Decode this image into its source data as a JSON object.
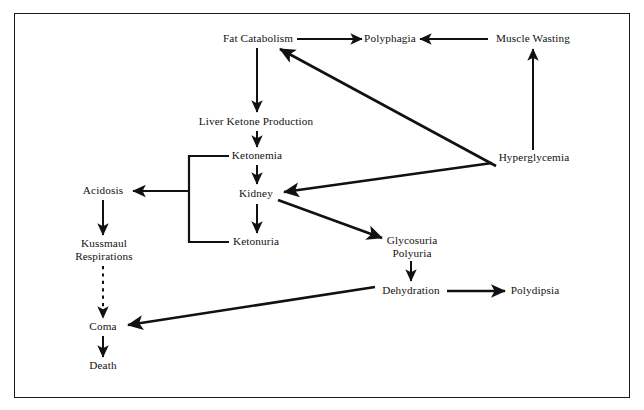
{
  "diagram": {
    "type": "flowchart",
    "border_color": "#1a1a1a",
    "line_color": "#111111",
    "background": "#ffffff",
    "nodes": [
      {
        "id": "fat_catabolism",
        "label": "Fat Catabolism",
        "x": 258,
        "y": 39
      },
      {
        "id": "polyphagia",
        "label": "Polyphagia",
        "x": 390,
        "y": 39
      },
      {
        "id": "muscle_wasting",
        "label": "Muscle Wasting",
        "x": 533,
        "y": 39
      },
      {
        "id": "liver_ketone",
        "label": "Liver Ketone Production",
        "x": 256,
        "y": 122
      },
      {
        "id": "ketonemia",
        "label": "Ketonemia",
        "x": 257,
        "y": 156
      },
      {
        "id": "hyperglycemia",
        "label": "Hyperglycemia",
        "x": 534,
        "y": 158
      },
      {
        "id": "acidosis",
        "label": "Acidosis",
        "x": 103,
        "y": 191
      },
      {
        "id": "kidney",
        "label": "Kidney",
        "x": 256,
        "y": 194
      },
      {
        "id": "ketonuria",
        "label": "Ketonuria",
        "x": 256,
        "y": 242
      },
      {
        "id": "glycosuria_polyuria",
        "label": "Glycosuria",
        "label2": "Polyuria",
        "x": 412,
        "y": 247
      },
      {
        "id": "kussmaul",
        "label": "Kussmaul",
        "label2": "Respirations",
        "x": 104,
        "y": 250
      },
      {
        "id": "dehydration",
        "label": "Dehydration",
        "x": 411,
        "y": 291
      },
      {
        "id": "polydipsia",
        "label": "Polydipsia",
        "x": 535,
        "y": 291
      },
      {
        "id": "coma",
        "label": "Coma",
        "x": 103,
        "y": 327
      },
      {
        "id": "death",
        "label": "Death",
        "x": 103,
        "y": 366
      }
    ],
    "edges": [
      {
        "id": "fat-to-polyphagia",
        "from": "fat_catabolism",
        "to": "polyphagia",
        "style": "solid",
        "arrow": "end"
      },
      {
        "id": "muscle-to-polyphagia",
        "from": "muscle_wasting",
        "to": "polyphagia",
        "style": "solid",
        "arrow": "end"
      },
      {
        "id": "hyper-to-muscle",
        "from": "hyperglycemia",
        "to": "muscle_wasting",
        "style": "solid",
        "arrow": "end"
      },
      {
        "id": "fat-to-liver",
        "from": "fat_catabolism",
        "to": "liver_ketone",
        "style": "solid",
        "arrow": "end"
      },
      {
        "id": "liver-to-ketonemia",
        "from": "liver_ketone",
        "to": "ketonemia",
        "style": "solid",
        "arrow": "end"
      },
      {
        "id": "hyper-to-fat",
        "from": "hyperglycemia",
        "to": "fat_catabolism",
        "style": "solid",
        "arrow": "end"
      },
      {
        "id": "hyper-to-kidney",
        "from": "hyperglycemia",
        "to": "kidney",
        "style": "solid",
        "arrow": "end"
      },
      {
        "id": "ketonemia-to-kidney",
        "from": "ketonemia",
        "to": "kidney",
        "style": "solid",
        "arrow": "end"
      },
      {
        "id": "kidney-to-ketonuria",
        "from": "kidney",
        "to": "ketonuria",
        "style": "solid",
        "arrow": "end"
      },
      {
        "id": "bracket-to-acidosis",
        "from": "ketonemia+ketonuria",
        "to": "acidosis",
        "style": "solid-bracket",
        "arrow": "end"
      },
      {
        "id": "kidney-to-glycosuria",
        "from": "kidney",
        "to": "glycosuria_polyuria",
        "style": "solid",
        "arrow": "end"
      },
      {
        "id": "acidosis-to-kussmaul",
        "from": "acidosis",
        "to": "kussmaul",
        "style": "solid",
        "arrow": "end"
      },
      {
        "id": "kussmaul-to-coma",
        "from": "kussmaul",
        "to": "coma",
        "style": "dashed",
        "arrow": "end"
      },
      {
        "id": "glycosuria-to-dehydration",
        "from": "glycosuria_polyuria",
        "to": "dehydration",
        "style": "solid",
        "arrow": "end"
      },
      {
        "id": "dehydration-to-polydipsia",
        "from": "dehydration",
        "to": "polydipsia",
        "style": "solid",
        "arrow": "end"
      },
      {
        "id": "dehydration-to-coma",
        "from": "dehydration",
        "to": "coma",
        "style": "solid",
        "arrow": "end"
      },
      {
        "id": "coma-to-death",
        "from": "coma",
        "to": "death",
        "style": "solid",
        "arrow": "end"
      }
    ]
  }
}
